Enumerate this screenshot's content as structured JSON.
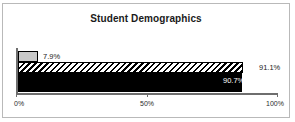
{
  "chart_data": {
    "type": "bar",
    "orientation": "horizontal",
    "title": "Student Demographics",
    "xlabel": "",
    "ylabel": "",
    "xlim": [
      0,
      100
    ],
    "grid": false,
    "legend": false,
    "tick_labels": [
      "0%",
      "50%",
      "100%"
    ],
    "tick_values": [
      0,
      50,
      100
    ],
    "categories": [
      "series-1",
      "series-2",
      "series-3"
    ],
    "values": [
      7.9,
      91.1,
      90.7
    ],
    "data_labels": [
      "7.9%",
      "91.1%",
      "90.7%"
    ],
    "series": [
      {
        "name": "series-1",
        "value": 7.9,
        "label": "7.9%",
        "fill": "light-gray",
        "label_position": "outside"
      },
      {
        "name": "series-2",
        "value": 91.1,
        "label": "91.1%",
        "fill": "diagonal-hatch",
        "label_position": "outside"
      },
      {
        "name": "series-3",
        "value": 90.7,
        "label": "90.7%",
        "fill": "solid-black",
        "label_position": "inside"
      }
    ]
  },
  "colors": {
    "frame_border": "#b9b9b9",
    "axis": "#6e6e6e",
    "bar_gray": "#c8c8c8",
    "bar_black": "#000000",
    "text": "#1a1a1a",
    "background": "#ffffff"
  }
}
